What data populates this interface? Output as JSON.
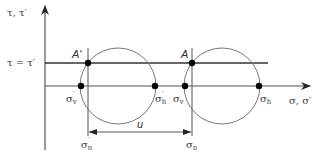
{
  "diagram": {
    "type": "mohr-circle",
    "axes": {
      "y_label": "τ, τ′",
      "x_label": "σ, σ′"
    },
    "shear_line_label": "τ = τ′",
    "points": {
      "A_prime": "A′",
      "A": "A"
    },
    "normal_stress_labels": {
      "sigma_v_prime": {
        "base": "σ",
        "sub": "v",
        "prime": "′"
      },
      "sigma_h_prime": {
        "base": "σ",
        "sub": "h",
        "prime": "′"
      },
      "sigma_v": {
        "base": "σ",
        "sub": "v"
      },
      "sigma_h": {
        "base": "σ",
        "sub": "h"
      },
      "sigma_n_prime": {
        "base": "σ",
        "sub": "n",
        "prime": "′"
      },
      "sigma_n": {
        "base": "σ",
        "sub": "n"
      }
    },
    "dimension_label": "u",
    "colors": {
      "line": "#3a3a3a",
      "circle": "#707070",
      "dot": "#000000"
    }
  }
}
